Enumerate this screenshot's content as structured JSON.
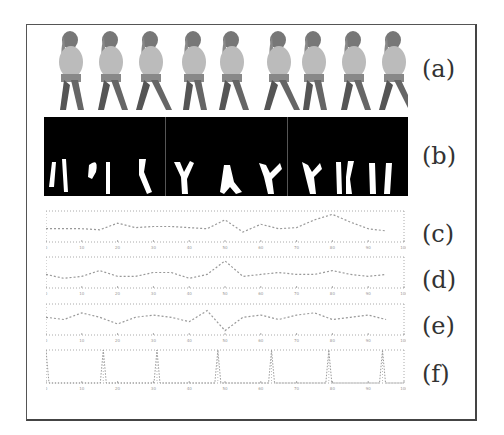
{
  "figure": {
    "panel_labels": [
      "(a)",
      "(b)",
      "(c)",
      "(d)",
      "(e)",
      "(f)"
    ],
    "panels": {
      "a": {
        "label": "(a)",
        "description": "Video frames of a walking person (9 frames)",
        "frame_count": 9
      },
      "b": {
        "label": "(b)",
        "description": "Binary silhouettes of the legs (9 frames, 3 groups)",
        "frame_count": 9,
        "groups": 3
      },
      "c": {
        "label": "(c)"
      },
      "d": {
        "label": "(d)"
      },
      "e": {
        "label": "(e)"
      },
      "f": {
        "label": "(f)"
      }
    },
    "colors": {
      "frame_border": "#555555",
      "plot_line": "#9a9a9a",
      "grid": "#aaaaaa",
      "silhouette_bg": "#000000",
      "silhouette_fg": "#ffffff"
    }
  },
  "chart_data": [
    {
      "type": "line",
      "panel": "(c)",
      "title": "",
      "xlabel": "",
      "ylabel": "",
      "xlim": [
        0,
        100
      ],
      "x_ticks": [
        "0",
        "10",
        "20",
        "30",
        "40",
        "50",
        "60",
        "70",
        "80",
        "90",
        "100"
      ],
      "y_ticks": [
        "0",
        "15",
        "20",
        "15",
        "5"
      ],
      "grid": true,
      "x": [
        0,
        5,
        10,
        15,
        20,
        25,
        30,
        35,
        40,
        45,
        50,
        55,
        60,
        65,
        70,
        75,
        80,
        85,
        90,
        95
      ],
      "values": [
        12,
        12,
        12,
        11,
        17,
        13,
        14,
        14,
        13,
        12,
        20,
        9,
        16,
        12,
        13,
        20,
        25,
        18,
        12,
        10
      ]
    },
    {
      "type": "line",
      "panel": "(d)",
      "title": "",
      "xlim": [
        0,
        100
      ],
      "x_ticks": [
        "0",
        "10",
        "20",
        "30",
        "40",
        "50",
        "60",
        "70",
        "80",
        "90",
        "100"
      ],
      "y_ticks": [
        "0",
        "50",
        "100",
        "40"
      ],
      "grid": true,
      "x": [
        0,
        5,
        10,
        15,
        20,
        25,
        30,
        35,
        40,
        45,
        50,
        55,
        60,
        65,
        70,
        75,
        80,
        85,
        90,
        95
      ],
      "values": [
        55,
        45,
        50,
        65,
        50,
        50,
        60,
        60,
        45,
        55,
        90,
        50,
        55,
        60,
        55,
        55,
        65,
        55,
        50,
        55
      ]
    },
    {
      "type": "line",
      "panel": "(e)",
      "title": "",
      "xlim": [
        0,
        100
      ],
      "x_ticks": [
        "0",
        "10",
        "20",
        "30",
        "40",
        "50",
        "60",
        "70",
        "80",
        "90",
        "100"
      ],
      "y_ticks": [
        "-40",
        "-20",
        "0",
        "20",
        "40"
      ],
      "grid": true,
      "x": [
        0,
        5,
        10,
        15,
        20,
        25,
        30,
        35,
        40,
        45,
        50,
        55,
        60,
        65,
        70,
        75,
        80,
        85,
        90,
        95
      ],
      "values": [
        0,
        -5,
        10,
        0,
        -15,
        0,
        5,
        0,
        -10,
        15,
        -30,
        0,
        5,
        -5,
        5,
        10,
        -5,
        0,
        5,
        -5
      ]
    },
    {
      "type": "line",
      "panel": "(f)",
      "title": "",
      "xlim": [
        0,
        100
      ],
      "ylim": [
        0,
        1
      ],
      "x_ticks": [
        "0",
        "10",
        "20",
        "30",
        "40",
        "50",
        "60",
        "70",
        "80",
        "90",
        "100"
      ],
      "y_ticks": [
        "0",
        "0.5",
        "1"
      ],
      "grid": true,
      "spike_positions": [
        0,
        16,
        31,
        48,
        63,
        79,
        94
      ],
      "values_description": "impulse train: 1 at spike positions, 0 elsewhere"
    }
  ]
}
